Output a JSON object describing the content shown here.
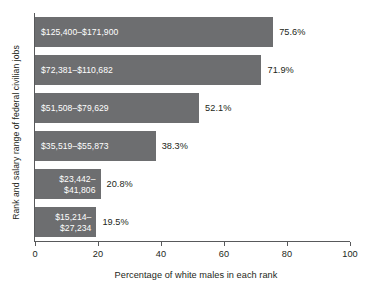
{
  "chart_data": {
    "type": "bar",
    "orientation": "horizontal",
    "title": "",
    "xlabel": "Percentage of white males in each rank",
    "ylabel": "Rank and salary range of federal civilian jobs",
    "xlim": [
      0,
      100
    ],
    "xticks": [
      0,
      20,
      40,
      60,
      80,
      100
    ],
    "xtick_labels": [
      "0",
      "20",
      "40",
      "60",
      "80",
      "100"
    ],
    "grid": false,
    "legend": false,
    "bar_color": "#6d6e70",
    "inside_label_color": "#ffffff",
    "value_label_color": "#231f20",
    "axis_color": "#58595b",
    "categories": [
      "$125,400–$171,900",
      "$72,381–$110,682",
      "$51,508–$79,629",
      "$35,519–$55,873",
      "$23,442–$41,806",
      "$15,214–$27,234"
    ],
    "values": [
      75.6,
      71.9,
      52.1,
      38.3,
      20.8,
      19.5
    ],
    "value_labels": [
      "75.6%",
      "71.9%",
      "52.1%",
      "38.3%",
      "20.8%",
      "19.5%"
    ],
    "bars": [
      {
        "category": "$125,400–$171,900",
        "label_line1": "$125,400–$171,900",
        "label_line2": "",
        "value": 75.6,
        "value_label": "75.6%",
        "label_wraps": false
      },
      {
        "category": "$72,381–$110,682",
        "label_line1": "$72,381–$110,682",
        "label_line2": "",
        "value": 71.9,
        "value_label": "71.9%",
        "label_wraps": false
      },
      {
        "category": "$51,508–$79,629",
        "label_line1": "$51,508–$79,629",
        "label_line2": "",
        "value": 52.1,
        "value_label": "52.1%",
        "label_wraps": false
      },
      {
        "category": "$35,519–$55,873",
        "label_line1": "$35,519–$55,873",
        "label_line2": "",
        "value": 38.3,
        "value_label": "38.3%",
        "label_wraps": false
      },
      {
        "category": "$23,442–$41,806",
        "label_line1": "$23,442–",
        "label_line2": "$41,806",
        "value": 20.8,
        "value_label": "20.8%",
        "label_wraps": true
      },
      {
        "category": "$15,214–$27,234",
        "label_line1": "$15,214–",
        "label_line2": "$27,234",
        "value": 19.5,
        "value_label": "19.5%",
        "label_wraps": true
      }
    ]
  }
}
